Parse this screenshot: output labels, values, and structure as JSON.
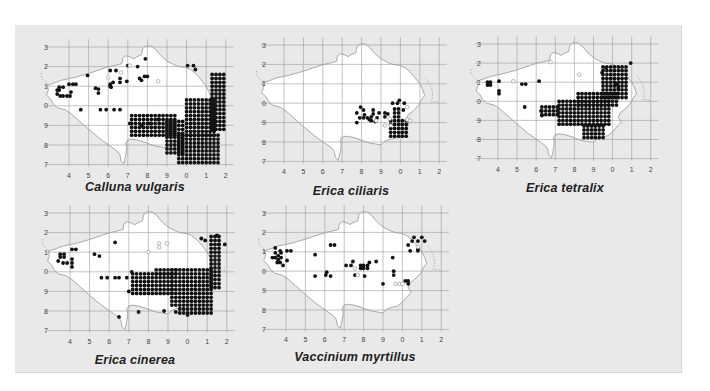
{
  "figure": {
    "background": "#e9e9e9",
    "grid_color": "#9a9a9a",
    "land_color": "#ffffff",
    "dot_color": "#111111",
    "open_dot_color": "#9a9a9a"
  },
  "axes": {
    "y_ticks": [
      "3",
      "2",
      "1",
      "0",
      "9",
      "8",
      "7"
    ],
    "x_ticks": [
      "4",
      "5",
      "6",
      "7",
      "8",
      "9",
      "0",
      "1",
      "2"
    ]
  },
  "maps": [
    {
      "id": "calluna",
      "caption": "Calluna vulgaris",
      "origin": [
        69,
        47
      ],
      "cell": 19.6,
      "label_x": 44,
      "caption_pos": [
        135,
        188
      ],
      "dense": [
        [
          5.6,
          4.5,
          7.8,
          6.0
        ],
        [
          6.0,
          2.7,
          7.6,
          4.6
        ],
        [
          7.3,
          1.4,
          8.0,
          4.3
        ],
        [
          3.2,
          3.5,
          5.6,
          4.6
        ],
        [
          5.0,
          3.8,
          6.0,
          5.6
        ]
      ],
      "points": [
        [
          6.05,
          0.95
        ],
        [
          6.35,
          0.95
        ],
        [
          6.45,
          1.15
        ],
        [
          3.0,
          0.95
        ],
        [
          3.5,
          1.0
        ],
        [
          2.1,
          1.2
        ],
        [
          2.4,
          1.2
        ],
        [
          3.6,
          1.6
        ],
        [
          3.85,
          1.5
        ],
        [
          4.0,
          1.5
        ],
        [
          2.6,
          1.6
        ],
        [
          2.6,
          1.8
        ],
        [
          2.95,
          1.75
        ],
        [
          2.1,
          1.9
        ],
        [
          2.1,
          2.0
        ],
        [
          1.35,
          2.1
        ],
        [
          1.5,
          2.15
        ],
        [
          1.5,
          2.35
        ],
        [
          0.0,
          1.9
        ],
        [
          0.2,
          1.9
        ],
        [
          0.35,
          1.9
        ],
        [
          -0.6,
          2.2
        ],
        [
          -0.5,
          2.2
        ],
        [
          -0.6,
          2.4
        ],
        [
          -0.45,
          2.5
        ],
        [
          -0.3,
          2.5
        ],
        [
          -0.1,
          2.5
        ],
        [
          0.05,
          2.5
        ],
        [
          0.1,
          2.3
        ],
        [
          -0.5,
          2.05
        ],
        [
          -0.3,
          2.05
        ],
        [
          1.6,
          3.2
        ],
        [
          1.9,
          3.2
        ],
        [
          2.3,
          3.2
        ],
        [
          2.6,
          3.2
        ],
        [
          3.1,
          3.9
        ],
        [
          2.15,
          2.05
        ],
        [
          2.25,
          1.8
        ],
        [
          0.95,
          1.45
        ],
        [
          0.6,
          3.2
        ],
        [
          4.1,
          3.9
        ],
        [
          3.9,
          0.6
        ],
        [
          3.7,
          1.7
        ],
        [
          4.55,
          3.7
        ],
        [
          3.7,
          4.0
        ]
      ],
      "open_points": [
        [
          3.1,
          0.95
        ],
        [
          2.0,
          1.55
        ],
        [
          4.55,
          1.75
        ],
        [
          2.65,
          1.3
        ]
      ]
    },
    {
      "id": "erica-ciliaris",
      "caption": "Erica ciliaris",
      "origin": [
        284,
        45
      ],
      "cell": 19.4,
      "label_x": 262,
      "caption_pos": [
        351,
        192
      ],
      "dense": [
        [
          5.5,
          3.9,
          6.4,
          4.7
        ],
        [
          5.7,
          3.3,
          6.1,
          3.9
        ]
      ],
      "points": [
        [
          3.95,
          3.2
        ],
        [
          4.1,
          3.35
        ],
        [
          4.15,
          3.6
        ],
        [
          3.75,
          3.5
        ],
        [
          3.9,
          3.75
        ],
        [
          4.1,
          3.75
        ],
        [
          4.3,
          3.75
        ],
        [
          3.75,
          4.0
        ],
        [
          4.6,
          3.35
        ],
        [
          4.9,
          3.5
        ],
        [
          5.2,
          3.5
        ],
        [
          5.2,
          3.7
        ],
        [
          4.5,
          3.7
        ],
        [
          4.5,
          3.9
        ],
        [
          4.7,
          3.95
        ],
        [
          4.4,
          3.85
        ],
        [
          5.6,
          3.0
        ],
        [
          5.85,
          3.0
        ],
        [
          5.95,
          2.85
        ],
        [
          6.2,
          3.0
        ],
        [
          4.8,
          3.75
        ],
        [
          4.6,
          3.55
        ],
        [
          5.35,
          3.55
        ],
        [
          6.15,
          3.35
        ]
      ],
      "open_points": [
        [
          4.75,
          3.9
        ],
        [
          5.45,
          3.8
        ],
        [
          6.35,
          3.2
        ],
        [
          6.35,
          3.85
        ],
        [
          5.5,
          4.15
        ],
        [
          5.2,
          4.15
        ],
        [
          6.5,
          3.9
        ]
      ]
    },
    {
      "id": "erica-tetralix",
      "caption": "Erica tetralix",
      "origin": [
        498,
        44
      ],
      "cell": 19.1,
      "label_x": 477,
      "caption_pos": [
        565,
        189
      ],
      "dense": [
        [
          5.5,
          1.2,
          6.8,
          3.0
        ],
        [
          3.2,
          3.0,
          6.0,
          4.3
        ],
        [
          4.2,
          2.6,
          6.4,
          3.3
        ],
        [
          4.5,
          4.3,
          5.6,
          4.9
        ],
        [
          2.3,
          3.3,
          3.2,
          3.8
        ]
      ],
      "points": [
        [
          6.95,
          1.0
        ],
        [
          5.45,
          1.5
        ],
        [
          5.65,
          1.25
        ],
        [
          2.15,
          1.95
        ],
        [
          -0.55,
          2.0
        ],
        [
          -0.4,
          2.0
        ],
        [
          -0.55,
          2.15
        ],
        [
          -0.4,
          2.15
        ],
        [
          0.05,
          1.95
        ],
        [
          0.05,
          2.45
        ],
        [
          0.05,
          2.6
        ],
        [
          1.25,
          2.1
        ],
        [
          1.45,
          2.1
        ],
        [
          1.4,
          3.3
        ],
        [
          2.25,
          3.5
        ],
        [
          6.3,
          2.3
        ],
        [
          6.2,
          2.1
        ],
        [
          2.3,
          3.75
        ]
      ],
      "open_points": [
        [
          0.8,
          1.95
        ],
        [
          2.75,
          0.95
        ],
        [
          4.25,
          1.6
        ]
      ]
    },
    {
      "id": "erica-cinerea",
      "caption": "Erica cinerea",
      "origin": [
        70,
        213
      ],
      "cell": 19.6,
      "label_x": 44,
      "caption_pos": [
        135,
        361
      ],
      "dense": [
        [
          5.2,
          2.9,
          7.4,
          4.9
        ],
        [
          7.2,
          1.2,
          7.8,
          3.9
        ],
        [
          3.2,
          3.1,
          5.4,
          4.3
        ],
        [
          5.6,
          4.9,
          7.4,
          5.2
        ],
        [
          4.4,
          2.9,
          5.6,
          3.2
        ]
      ],
      "points": [
        [
          6.7,
          1.3
        ],
        [
          6.9,
          1.4
        ],
        [
          7.5,
          1.15
        ],
        [
          7.6,
          1.6
        ],
        [
          7.9,
          1.6
        ],
        [
          2.3,
          1.5
        ],
        [
          1.25,
          2.1
        ],
        [
          1.5,
          2.2
        ],
        [
          0.1,
          1.85
        ],
        [
          0.3,
          1.85
        ],
        [
          -0.5,
          2.1
        ],
        [
          -0.3,
          2.1
        ],
        [
          -0.5,
          2.25
        ],
        [
          -0.3,
          2.25
        ],
        [
          -0.6,
          2.45
        ],
        [
          -0.35,
          2.55
        ],
        [
          -0.15,
          2.55
        ],
        [
          0.1,
          2.55
        ],
        [
          0.1,
          2.35
        ],
        [
          0.1,
          2.75
        ],
        [
          1.6,
          3.3
        ],
        [
          1.9,
          3.3
        ],
        [
          2.3,
          3.3
        ],
        [
          2.5,
          3.3
        ],
        [
          2.9,
          3.3
        ],
        [
          3.0,
          4.0
        ],
        [
          2.5,
          5.3
        ],
        [
          3.5,
          5.05
        ],
        [
          4.8,
          5.0
        ],
        [
          5.4,
          5.05
        ],
        [
          6.0,
          5.2
        ],
        [
          3.15,
          3.0
        ]
      ],
      "open_points": [
        [
          4.55,
          1.55
        ],
        [
          4.95,
          1.55
        ],
        [
          4.0,
          2.0
        ],
        [
          4.55,
          1.75
        ]
      ]
    },
    {
      "id": "vaccinium",
      "caption": "Vaccinium myrtillus",
      "origin": [
        286,
        213
      ],
      "cell": 19.4,
      "label_x": 262,
      "caption_pos": [
        355,
        358
      ],
      "dense": [],
      "points": [
        [
          -0.55,
          1.8
        ],
        [
          -0.55,
          2.05
        ],
        [
          -0.55,
          2.3
        ],
        [
          -0.4,
          2.2
        ],
        [
          -0.4,
          2.4
        ],
        [
          -0.25,
          2.05
        ],
        [
          -0.25,
          2.3
        ],
        [
          -0.3,
          1.95
        ],
        [
          -0.7,
          2.3
        ],
        [
          -0.45,
          2.55
        ],
        [
          -0.3,
          2.55
        ],
        [
          0.05,
          1.95
        ],
        [
          0.25,
          1.95
        ],
        [
          0.05,
          2.45
        ],
        [
          -0.15,
          2.7
        ],
        [
          1.5,
          2.15
        ],
        [
          2.3,
          1.65
        ],
        [
          2.5,
          1.65
        ],
        [
          1.5,
          3.25
        ],
        [
          2.1,
          3.05
        ],
        [
          2.05,
          3.2
        ],
        [
          2.3,
          3.25
        ],
        [
          3.1,
          2.7
        ],
        [
          3.35,
          2.7
        ],
        [
          3.45,
          2.5
        ],
        [
          3.55,
          3.2
        ],
        [
          3.85,
          2.7
        ],
        [
          4.0,
          2.7
        ],
        [
          3.85,
          2.85
        ],
        [
          4.0,
          2.85
        ],
        [
          4.2,
          2.7
        ],
        [
          4.3,
          2.55
        ],
        [
          4.2,
          2.85
        ],
        [
          4.05,
          3.25
        ],
        [
          4.65,
          2.5
        ],
        [
          5.5,
          2.3
        ],
        [
          5.55,
          3.0
        ],
        [
          5.55,
          3.2
        ],
        [
          5.0,
          3.65
        ],
        [
          6.3,
          3.5
        ],
        [
          6.3,
          3.65
        ],
        [
          6.15,
          3.5
        ],
        [
          6.3,
          1.65
        ],
        [
          6.5,
          1.45
        ],
        [
          6.8,
          1.45
        ],
        [
          6.8,
          1.85
        ],
        [
          6.8,
          1.95
        ],
        [
          6.4,
          1.95
        ],
        [
          7.15,
          1.45
        ],
        [
          6.6,
          1.25
        ],
        [
          7.0,
          1.25
        ]
      ],
      "open_points": [
        [
          3.7,
          3.2
        ],
        [
          3.55,
          2.85
        ],
        [
          6.8,
          1.75
        ],
        [
          5.65,
          3.65
        ],
        [
          5.85,
          3.65
        ],
        [
          6.0,
          3.65
        ]
      ]
    }
  ]
}
